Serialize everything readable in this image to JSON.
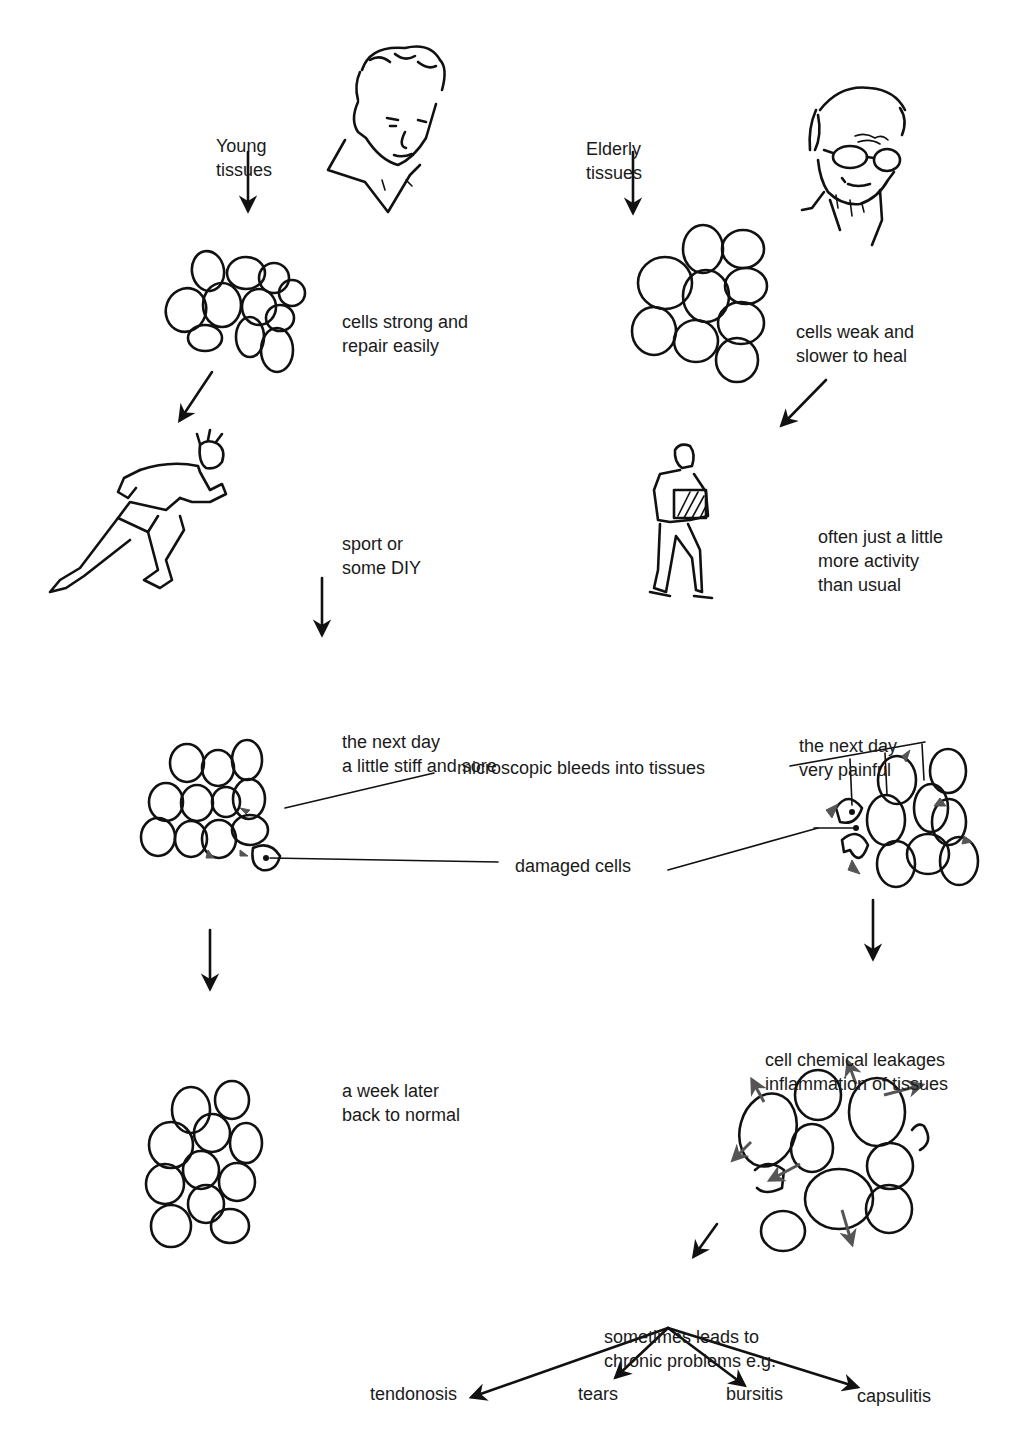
{
  "columns": {
    "young": {
      "title": [
        "Young",
        "tissues"
      ],
      "steps": [
        {
          "id": "cells",
          "text": [
            "cells strong and",
            "repair easily"
          ]
        },
        {
          "id": "activity",
          "text": [
            "sport or",
            "some DIY"
          ]
        },
        {
          "id": "next_day",
          "text": [
            "the next day",
            "a little stiff and sore"
          ]
        },
        {
          "id": "week_later",
          "text": [
            "a week later",
            "back to normal"
          ]
        }
      ]
    },
    "elderly": {
      "title": [
        "Elderly",
        "tissues"
      ],
      "steps": [
        {
          "id": "cells",
          "text": [
            "cells weak and",
            "slower to heal"
          ]
        },
        {
          "id": "activity",
          "text": [
            "often just a little",
            "more activity",
            "than usual"
          ]
        },
        {
          "id": "next_day",
          "text": [
            "the next day",
            "very painful"
          ]
        },
        {
          "id": "inflammation",
          "text": [
            "cell chemical leakages",
            "inflammation of tissues"
          ]
        },
        {
          "id": "chronic",
          "text": [
            "sometimes leads to",
            "chronic problems e.g."
          ]
        }
      ]
    }
  },
  "shared_callouts": {
    "bleeds": "microscopic bleeds into tissues",
    "damaged": "damaged cells"
  },
  "chronic_problems": [
    "tendonosis",
    "tears",
    "bursitis",
    "capsulitis"
  ],
  "illustrations": {
    "young_face": "young-man-head-sketch",
    "old_face": "elderly-man-head-sketch",
    "runner": "sprinting-man-sketch",
    "lifter": "man-carrying-box-sketch"
  },
  "colors": {
    "ink": "#111111",
    "bleed_shading": "#555555",
    "background": "#ffffff"
  }
}
